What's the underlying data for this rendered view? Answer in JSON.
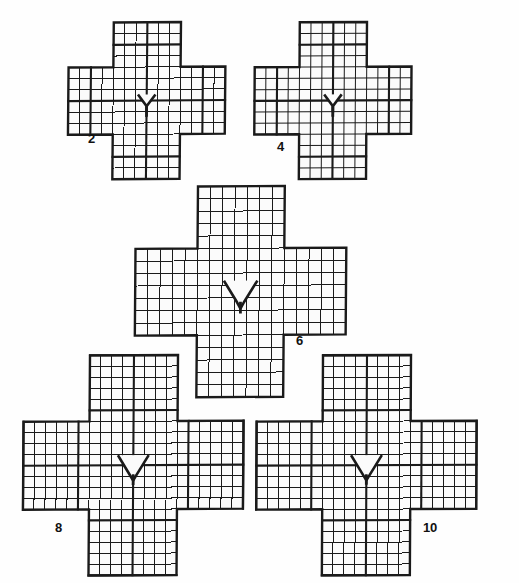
{
  "sheet": {
    "background_color": "#fefefe",
    "ink_color": "#1a1a1a",
    "cell_fill_color": "#fbfbfb",
    "description": "Five cross-shaped (plus) square-grid diagrams of increasing size, each with a V/triangular notch at the centre, labelled with even numbers."
  },
  "chart_data": {
    "type": "diagram",
    "title": "",
    "figures": [
      {
        "label": "2",
        "arm_cells": 4,
        "center_cells": 6,
        "total_cells_across": 14,
        "notch": "narrow-v",
        "notch_width_cells": 1.6,
        "notch_depth_cells": 1.1
      },
      {
        "label": "4",
        "arm_cells": 4,
        "center_cells": 6,
        "total_cells_across": 14,
        "notch": "narrow-v",
        "notch_width_cells": 1.6,
        "notch_depth_cells": 1.1
      },
      {
        "label": "6",
        "arm_cells": 5,
        "center_cells": 7,
        "total_cells_across": 17,
        "notch": "wide-trapezoid-v",
        "notch_width_cells": 2.6,
        "notch_depth_cells": 1.7
      },
      {
        "label": "8",
        "arm_cells": 6,
        "center_cells": 8,
        "total_cells_across": 20,
        "notch": "wide-trapezoid-v",
        "notch_width_cells": 2.8,
        "notch_depth_cells": 1.8
      },
      {
        "label": "10",
        "arm_cells": 6,
        "center_cells": 8,
        "total_cells_across": 20,
        "notch": "wide-trapezoid-v",
        "notch_width_cells": 2.8,
        "notch_depth_cells": 1.8
      }
    ],
    "labels": [
      "2",
      "4",
      "6",
      "8",
      "10"
    ],
    "xlabel": "",
    "ylabel": ""
  },
  "figures": [
    {
      "name": "figure-2",
      "label": "2",
      "x": 63,
      "y": 16,
      "cell": 11.2,
      "arm": 4,
      "center": 6,
      "notch_half_w": 0.78,
      "notch_depth": 1.05,
      "notch_flat": 0.0,
      "skew": -1.8,
      "label_x": 88,
      "label_y": 132
    },
    {
      "name": "figure-4",
      "label": "4",
      "x": 249,
      "y": 16,
      "cell": 11.2,
      "arm": 4,
      "center": 6,
      "notch_half_w": 0.78,
      "notch_depth": 1.05,
      "notch_flat": 0.0,
      "skew": -1.2,
      "label_x": 277,
      "label_y": 140
    },
    {
      "name": "figure-6",
      "label": "6",
      "x": 130,
      "y": 180,
      "cell": 12.4,
      "arm": 5,
      "center": 7,
      "notch_half_w": 1.35,
      "notch_depth": 1.7,
      "notch_flat": 0.55,
      "skew": -1.5,
      "label_x": 296,
      "label_y": 334
    },
    {
      "name": "figure-8",
      "label": "8",
      "x": 18,
      "y": 349,
      "cell": 11.0,
      "arm": 6,
      "center": 8,
      "notch_half_w": 1.4,
      "notch_depth": 1.75,
      "notch_flat": 0.6,
      "skew": -1.3,
      "label_x": 55,
      "label_y": 521
    },
    {
      "name": "figure-10",
      "label": "10",
      "x": 251,
      "y": 349,
      "cell": 11.0,
      "arm": 6,
      "center": 8,
      "notch_half_w": 1.4,
      "notch_depth": 1.75,
      "notch_flat": 0.6,
      "skew": -1.0,
      "label_x": 423,
      "label_y": 521
    }
  ]
}
